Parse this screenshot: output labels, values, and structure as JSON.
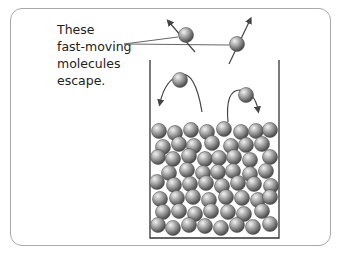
{
  "caption": {
    "lines": [
      "These",
      "fast-moving",
      "molecules",
      "escape."
    ]
  },
  "colors": {
    "frame": "#a8a8a8",
    "beaker": "#333333",
    "molecule_light": "#e6e6e6",
    "molecule_mid": "#a0a0a0",
    "molecule_dark": "#555555",
    "arrow": "#444444",
    "pointer": "#666666"
  },
  "diagram": {
    "beaker": {
      "x1": 150,
      "y_top": 60,
      "x2": 279,
      "y_bottom": 238
    },
    "escaping_molecules": [
      {
        "cx": 186,
        "cy": 35
      },
      {
        "cx": 237,
        "cy": 44
      }
    ],
    "returning_molecules": [
      {
        "cx": 180,
        "cy": 80
      },
      {
        "cx": 246,
        "cy": 95
      }
    ],
    "liquid_molecule_radius": 7.5
  }
}
